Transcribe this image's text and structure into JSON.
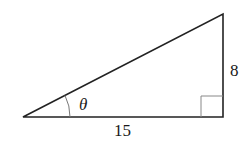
{
  "diagram": {
    "type": "right-triangle",
    "labels": {
      "vertical_side": "8",
      "horizontal_side": "15",
      "angle": "θ"
    },
    "right_angle_marker": true,
    "colors": {
      "stroke": "#222222",
      "marker": "#888888",
      "background": "#ffffff"
    }
  }
}
